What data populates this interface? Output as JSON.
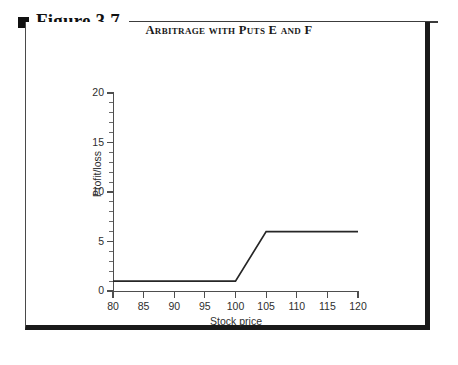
{
  "figure": {
    "bullet_icon": "filled-square-icon",
    "label": "Figure 3.7"
  },
  "chart_data": {
    "type": "line",
    "title": "Arbitrage with Puts E and F",
    "xlabel": "Stock price",
    "ylabel": "Profit/loss",
    "xlim": [
      80,
      120
    ],
    "ylim": [
      0,
      20
    ],
    "grid": false,
    "legend": null,
    "x_ticks": [
      80,
      85,
      90,
      95,
      100,
      105,
      110,
      115,
      120
    ],
    "y_ticks": [
      0,
      5,
      10,
      15,
      20
    ],
    "y_minor_tick_step": 1,
    "line_color": "#262626",
    "series": [
      {
        "name": "Profit/loss",
        "x": [
          80,
          100,
          105,
          120
        ],
        "values": [
          1,
          1,
          6,
          6
        ]
      }
    ]
  }
}
